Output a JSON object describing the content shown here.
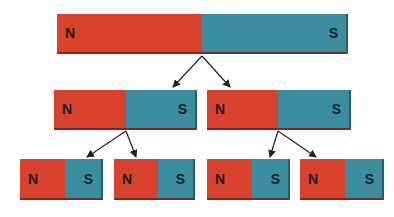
{
  "colors": {
    "north": "#d9432e",
    "south": "#3a8ea0",
    "arrow": "#222222"
  },
  "magnets": [
    {
      "id": "large",
      "x": 57,
      "y": 14,
      "w": 291,
      "h": 40,
      "split": 145,
      "north_label": "N",
      "south_label": "S"
    },
    {
      "id": "mid-left",
      "x": 54,
      "y": 90,
      "w": 143,
      "h": 40,
      "split": 72,
      "north_label": "N",
      "south_label": "S"
    },
    {
      "id": "mid-right",
      "x": 207,
      "y": 90,
      "w": 144,
      "h": 40,
      "split": 71,
      "north_label": "N",
      "south_label": "S"
    },
    {
      "id": "small-1",
      "x": 20,
      "y": 159,
      "w": 83,
      "h": 41,
      "split": 45,
      "north_label": "N",
      "south_label": "S"
    },
    {
      "id": "small-2",
      "x": 114,
      "y": 159,
      "w": 81,
      "h": 41,
      "split": 44,
      "north_label": "N",
      "south_label": "S"
    },
    {
      "id": "small-3",
      "x": 207,
      "y": 159,
      "w": 83,
      "h": 41,
      "split": 45,
      "north_label": "N",
      "south_label": "S"
    },
    {
      "id": "small-4",
      "x": 300,
      "y": 159,
      "w": 84,
      "h": 41,
      "split": 45,
      "north_label": "N",
      "south_label": "S"
    }
  ],
  "arrows": [
    {
      "from": [
        202,
        56
      ],
      "to": [
        173,
        87
      ]
    },
    {
      "from": [
        202,
        56
      ],
      "to": [
        230,
        87
      ]
    },
    {
      "from": [
        126,
        131
      ],
      "to": [
        87,
        157
      ]
    },
    {
      "from": [
        126,
        131
      ],
      "to": [
        136,
        157
      ]
    },
    {
      "from": [
        278,
        131
      ],
      "to": [
        270,
        157
      ]
    },
    {
      "from": [
        278,
        131
      ],
      "to": [
        316,
        157
      ]
    }
  ]
}
